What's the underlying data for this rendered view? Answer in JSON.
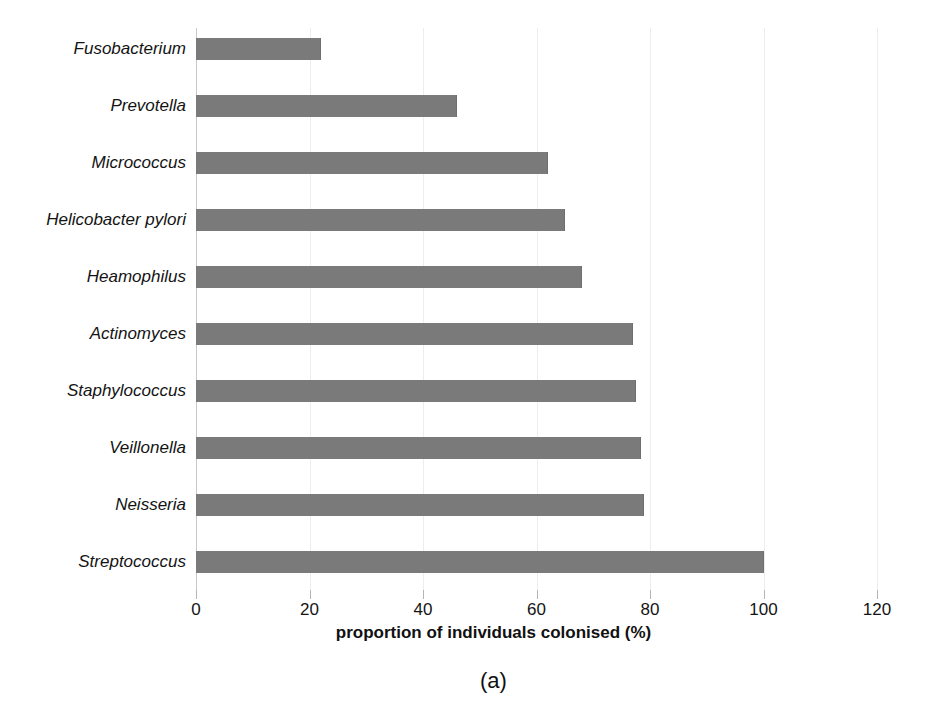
{
  "figure": {
    "caption": "(a)",
    "bar_color": "#7a7a7a",
    "background_color": "#ffffff",
    "gridline_color": "#ededed"
  },
  "chart_data": {
    "type": "bar",
    "orientation": "horizontal",
    "title": "",
    "subtitle": "",
    "xlabel": "proportion of individuals colonised (%)",
    "ylabel": "",
    "xlim": [
      0,
      120
    ],
    "xticks": [
      0,
      20,
      40,
      60,
      80,
      100,
      120
    ],
    "xtick_labels": [
      "0",
      "20",
      "40",
      "60",
      "80",
      "100",
      "120"
    ],
    "grid": true,
    "grid_axis": "x",
    "legend": false,
    "legend_position": "none",
    "categories": [
      "Fusobacterium",
      "Prevotella",
      "Micrococcus",
      "Helicobacter pylori",
      "Heamophilus",
      "Actinomyces",
      "Staphylococcus",
      "Veillonella",
      "Neisseria",
      "Streptococcus"
    ],
    "values": [
      22,
      46,
      62,
      65,
      68,
      77,
      77.5,
      78.5,
      79,
      100
    ],
    "series": [
      {
        "name": "proportion of individuals colonised (%)",
        "values": [
          22,
          46,
          62,
          65,
          68,
          77,
          77.5,
          78.5,
          79,
          100
        ]
      }
    ]
  }
}
